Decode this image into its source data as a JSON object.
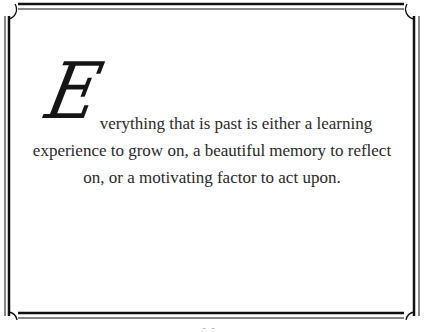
{
  "quote": {
    "drop_cap": "E",
    "lines": [
      "verything that is past is either a learning",
      "experience to grow on, a beautiful memory to reflect",
      "on, or a motivating factor to act upon."
    ],
    "full_text": "Everything that is past is either a learning experience to grow on, a beautiful memory to reflect on, or a motivating factor to act upon."
  },
  "frame": {
    "style": "double-line border with quarter-circle corner flourishes",
    "line_color": "#111111"
  },
  "page_mark": "- -"
}
